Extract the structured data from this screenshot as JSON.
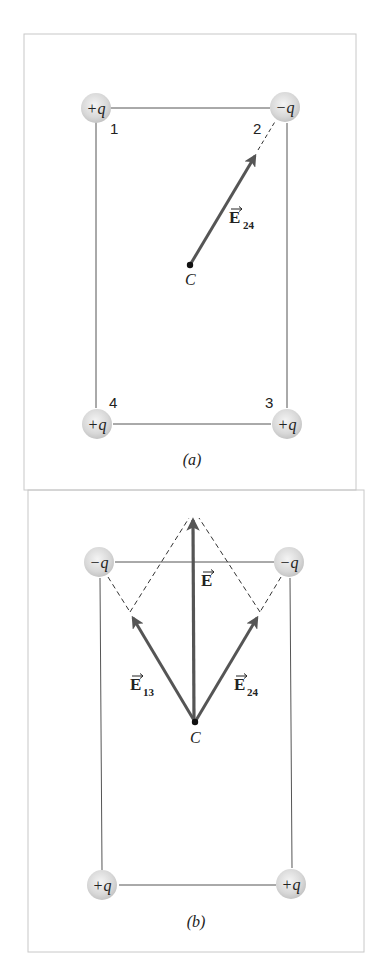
{
  "figure": {
    "colors": {
      "frame": "#c8c8c8",
      "square": "#555555",
      "vector": "#555555",
      "dashed": "#333333",
      "charge_fill": "#dcdcdc",
      "text": "#222222"
    },
    "panels": [
      {
        "id": "a",
        "caption": "(a)",
        "center_label": "C",
        "charges": [
          {
            "index": "1",
            "label": "+q",
            "position": "top-left"
          },
          {
            "index": "2",
            "label": "−q",
            "position": "top-right"
          },
          {
            "index": "3",
            "label": "+q",
            "position": "bottom-right"
          },
          {
            "index": "4",
            "label": "+q",
            "position": "bottom-left"
          }
        ],
        "vectors": [
          {
            "name": "E",
            "subscript": "24",
            "direction": "from C toward charge 2"
          }
        ]
      },
      {
        "id": "b",
        "caption": "(b)",
        "center_label": "C",
        "charges": [
          {
            "label": "−q",
            "position": "top-left"
          },
          {
            "label": "−q",
            "position": "top-right"
          },
          {
            "label": "+q",
            "position": "bottom-left"
          },
          {
            "label": "+q",
            "position": "bottom-right"
          }
        ],
        "vectors": [
          {
            "name": "E",
            "subscript": "13",
            "direction": "from C toward top-left"
          },
          {
            "name": "E",
            "subscript": "24",
            "direction": "from C toward top-right"
          },
          {
            "name": "E",
            "subscript": "",
            "direction": "net field, straight up"
          }
        ]
      }
    ]
  }
}
